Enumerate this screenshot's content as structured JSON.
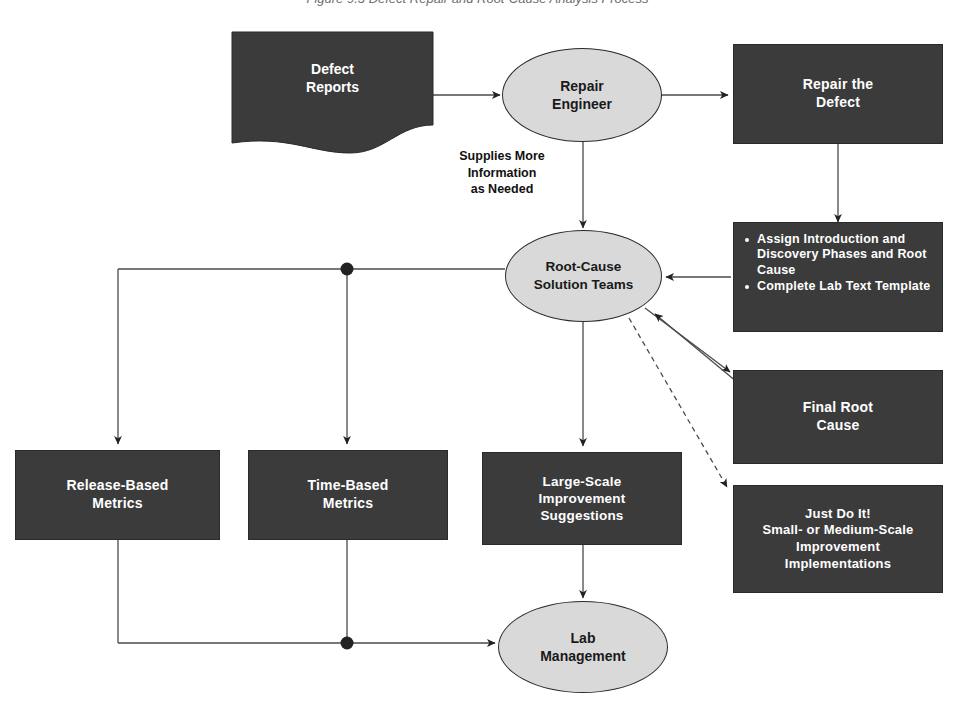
{
  "figure": {
    "title": "Figure 9.3 Defect Repair and Root-Cause Analysis Process",
    "background_color": "#ffffff",
    "dark_node_color": "#3b3b3b",
    "light_node_color": "#d9d9d9",
    "line_color": "#4a4a4a",
    "text_on_dark": "#ffffff",
    "text_on_light": "#1a1a1a"
  },
  "nodes": {
    "defect_reports": {
      "label": "Defect\nReports",
      "shape": "document",
      "style": "dark"
    },
    "repair_engineer": {
      "label": "Repair\nEngineer",
      "shape": "ellipse",
      "style": "light"
    },
    "repair_the_defect": {
      "label": "Repair the\nDefect",
      "shape": "rectangle",
      "style": "dark"
    },
    "assign_tasks": {
      "shape": "rectangle",
      "style": "dark",
      "bullets": [
        "Assign Introduction and Discovery Phases and Root Cause",
        "Complete Lab Text Template"
      ]
    },
    "root_cause_solution_teams": {
      "label": "Root-Cause\nSolution Teams",
      "shape": "ellipse",
      "style": "light"
    },
    "final_root_cause": {
      "label": "Final Root\nCause",
      "shape": "rectangle",
      "style": "dark"
    },
    "just_do_it": {
      "label": "Just Do It!\nSmall- or Medium-Scale\nImprovement\nImplementations",
      "shape": "rectangle",
      "style": "dark"
    },
    "release_based_metrics": {
      "label": "Release-Based\nMetrics",
      "shape": "rectangle",
      "style": "dark"
    },
    "time_based_metrics": {
      "label": "Time-Based\nMetrics",
      "shape": "rectangle",
      "style": "dark"
    },
    "large_scale_suggestions": {
      "label": "Large-Scale\nImprovement\nSuggestions",
      "shape": "rectangle",
      "style": "dark"
    },
    "lab_management": {
      "label": "Lab\nManagement",
      "shape": "ellipse",
      "style": "light"
    }
  },
  "edge_labels": {
    "supplies_more_information": "Supplies More\nInformation\nas Needed"
  },
  "edges": [
    {
      "from": "defect_reports",
      "to": "repair_engineer",
      "style": "solid",
      "arrow": true
    },
    {
      "from": "repair_engineer",
      "to": "repair_the_defect",
      "style": "solid",
      "arrow": true
    },
    {
      "from": "repair_engineer",
      "to": "root_cause_solution_teams",
      "style": "solid",
      "arrow": true,
      "label": "Supplies More Information as Needed"
    },
    {
      "from": "repair_the_defect",
      "to": "assign_tasks",
      "style": "solid",
      "arrow": true
    },
    {
      "from": "assign_tasks",
      "to": "root_cause_solution_teams",
      "style": "solid",
      "arrow": true
    },
    {
      "from": "root_cause_solution_teams",
      "to": "final_root_cause",
      "style": "solid",
      "arrow": true
    },
    {
      "from": "root_cause_solution_teams",
      "to": "just_do_it",
      "style": "dashed",
      "arrow": true
    },
    {
      "from": "root_cause_solution_teams",
      "to": "release_based_metrics",
      "style": "solid",
      "arrow": true
    },
    {
      "from": "root_cause_solution_teams",
      "to": "time_based_metrics",
      "style": "solid",
      "arrow": true
    },
    {
      "from": "root_cause_solution_teams",
      "to": "large_scale_suggestions",
      "style": "solid",
      "arrow": true
    },
    {
      "from": "release_based_metrics",
      "to": "lab_management",
      "style": "solid",
      "arrow": true
    },
    {
      "from": "time_based_metrics",
      "to": "lab_management",
      "style": "solid",
      "arrow": true
    },
    {
      "from": "large_scale_suggestions",
      "to": "lab_management",
      "style": "solid",
      "arrow": true
    }
  ],
  "junctions": [
    {
      "name": "upper-branch-junction",
      "x": 347,
      "y": 269
    },
    {
      "name": "lower-merge-junction",
      "x": 347,
      "y": 643
    }
  ]
}
